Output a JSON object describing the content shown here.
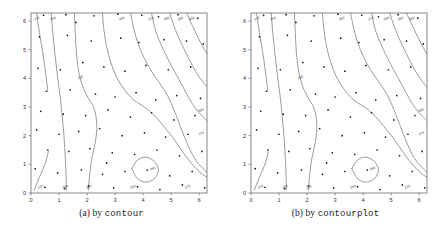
{
  "figure": {
    "background_color": "#ffffff",
    "line_color": "#4a4a4a",
    "point_color": "#111111",
    "axis_color": "#555555",
    "label_color": "#333333"
  },
  "panels": [
    {
      "id": "a",
      "caption_prefix": "(a) by ",
      "caption_code": "contour",
      "frame": {
        "x": 31,
        "y": 13,
        "w": 176,
        "h": 180
      },
      "xaxis": {
        "ticks": [
          0,
          1,
          2,
          3,
          4,
          5,
          6
        ],
        "tick_labels": [
          "0",
          "1",
          "2",
          "3",
          "4",
          "5",
          "6"
        ],
        "min": 0,
        "max": 6.28
      },
      "yaxis": {
        "ticks": [
          0,
          1,
          2,
          3,
          4,
          5,
          6
        ],
        "tick_labels": [
          "0",
          "1",
          "2",
          "3",
          "4",
          "5",
          "6"
        ],
        "min": 0,
        "max": 6.28
      }
    },
    {
      "id": "b",
      "caption_prefix": "(b) by ",
      "caption_code": "contourplot",
      "frame": {
        "x": 27,
        "y": 13,
        "w": 176,
        "h": 180
      },
      "xaxis": {
        "ticks": [
          0,
          1,
          2,
          3,
          4,
          5,
          6
        ],
        "tick_labels": [
          "0",
          "1",
          "2",
          "3",
          "4",
          "5",
          "6"
        ],
        "min": 0,
        "max": 6.28
      },
      "yaxis": {
        "ticks": [
          0,
          1,
          2,
          3,
          4,
          5,
          6
        ],
        "tick_labels": [
          "0",
          "1",
          "2",
          "3",
          "4",
          "5",
          "6"
        ],
        "min": 0,
        "max": 6.28
      }
    }
  ],
  "chart_data": {
    "type": "line",
    "title": "",
    "xlabel": "",
    "ylabel": "",
    "xlim": [
      0,
      6.28
    ],
    "ylim": [
      0,
      6.28
    ],
    "grid": false,
    "legend": "none",
    "contour_levels": [
      175,
      200,
      225,
      250,
      275,
      300,
      325,
      350
    ],
    "level_label_texts": [
      "175",
      "200",
      "225",
      "250",
      "275",
      "300",
      "325",
      "350"
    ],
    "series": [
      {
        "name": "contour-level-175",
        "level": 175,
        "paths": [
          [
            [
              0.2,
              6.28
            ],
            [
              0.3,
              5.6
            ],
            [
              0.42,
              4.9
            ],
            [
              0.52,
              4.2
            ],
            [
              0.6,
              3.55
            ]
          ],
          [
            [
              0.12,
              0.1
            ],
            [
              0.3,
              0.55
            ],
            [
              0.5,
              1.0
            ],
            [
              0.62,
              1.45
            ]
          ]
        ],
        "labels": [
          {
            "text": "175",
            "x": 0.22,
            "y": 6.05
          },
          {
            "text": "175",
            "x": 0.35,
            "y": 0.18
          }
        ]
      },
      {
        "name": "contour-level-200",
        "level": 200,
        "paths": [
          [
            [
              0.72,
              6.28
            ],
            [
              0.78,
              5.55
            ],
            [
              0.86,
              4.8
            ],
            [
              0.95,
              4.05
            ],
            [
              1.05,
              3.3
            ],
            [
              1.12,
              2.6
            ],
            [
              1.18,
              1.95
            ],
            [
              1.22,
              1.3
            ],
            [
              1.25,
              0.65
            ],
            [
              1.26,
              0.1
            ]
          ]
        ],
        "labels": [
          {
            "text": "200",
            "x": 0.8,
            "y": 6.05
          },
          {
            "text": "200",
            "x": 1.24,
            "y": 0.18
          }
        ]
      },
      {
        "name": "contour-level-225",
        "level": 225,
        "paths": [
          [
            [
              1.55,
              6.28
            ],
            [
              1.58,
              5.6
            ],
            [
              1.62,
              4.9
            ],
            [
              1.7,
              4.25
            ],
            [
              1.85,
              3.7
            ],
            [
              2.05,
              3.3
            ],
            [
              2.25,
              2.95
            ],
            [
              2.35,
              2.4
            ],
            [
              2.3,
              1.8
            ],
            [
              2.18,
              1.25
            ],
            [
              2.1,
              0.7
            ],
            [
              2.05,
              0.1
            ]
          ]
        ],
        "labels": [
          {
            "text": "225",
            "x": 1.78,
            "y": 4.0
          },
          {
            "text": "225",
            "x": 2.08,
            "y": 0.18
          }
        ]
      },
      {
        "name": "contour-level-250",
        "level": 250,
        "paths": [
          [
            [
              2.55,
              6.28
            ],
            [
              2.6,
              5.7
            ],
            [
              2.7,
              5.1
            ],
            [
              2.85,
              4.55
            ],
            [
              3.05,
              4.05
            ],
            [
              3.3,
              3.65
            ],
            [
              3.55,
              3.35
            ],
            [
              3.8,
              3.15
            ],
            [
              4.05,
              3.0
            ],
            [
              4.3,
              2.8
            ],
            [
              4.55,
              2.55
            ],
            [
              4.8,
              2.25
            ],
            [
              5.05,
              1.95
            ],
            [
              5.3,
              1.6
            ],
            [
              5.55,
              1.25
            ],
            [
              5.8,
              0.95
            ],
            [
              6.05,
              0.7
            ],
            [
              6.28,
              0.55
            ]
          ]
        ],
        "labels": [
          {
            "text": "250",
            "x": 3.25,
            "y": 6.05
          },
          {
            "text": "250",
            "x": 3.65,
            "y": 0.18
          }
        ]
      },
      {
        "name": "contour-level-275",
        "level": 275,
        "paths": [
          [
            [
              3.55,
              6.28
            ],
            [
              3.7,
              5.6
            ],
            [
              3.9,
              5.0
            ],
            [
              4.15,
              4.5
            ],
            [
              4.4,
              4.1
            ],
            [
              4.65,
              3.75
            ],
            [
              4.9,
              3.35
            ],
            [
              5.1,
              2.9
            ],
            [
              5.3,
              2.4
            ],
            [
              5.5,
              1.9
            ],
            [
              5.7,
              1.45
            ],
            [
              5.95,
              1.05
            ],
            [
              6.2,
              0.8
            ],
            [
              6.28,
              0.72
            ]
          ]
        ],
        "labels": [
          {
            "text": "275",
            "x": 4.3,
            "y": 6.05
          },
          {
            "text": "275",
            "x": 5.6,
            "y": 0.18
          },
          {
            "text": "275",
            "x": 6.1,
            "y": 2.05
          }
        ]
      },
      {
        "name": "contour-level-300",
        "level": 300,
        "paths": [
          [
            [
              4.3,
              6.28
            ],
            [
              4.45,
              5.65
            ],
            [
              4.7,
              5.05
            ],
            [
              4.95,
              4.55
            ],
            [
              5.2,
              4.1
            ],
            [
              5.45,
              3.65
            ],
            [
              5.7,
              3.2
            ],
            [
              5.95,
              2.85
            ],
            [
              6.2,
              2.6
            ],
            [
              6.28,
              2.52
            ]
          ]
        ],
        "labels": [
          {
            "text": "300",
            "x": 4.85,
            "y": 6.05
          },
          {
            "text": "300",
            "x": 6.08,
            "y": 2.85
          }
        ]
      },
      {
        "name": "contour-level-325",
        "level": 325,
        "paths": [
          [
            [
              4.95,
              6.28
            ],
            [
              5.15,
              5.7
            ],
            [
              5.4,
              5.15
            ],
            [
              5.65,
              4.65
            ],
            [
              5.9,
              4.2
            ],
            [
              6.15,
              3.85
            ],
            [
              6.28,
              3.7
            ]
          ]
        ],
        "labels": [
          {
            "text": "325",
            "x": 5.35,
            "y": 6.05
          }
        ]
      },
      {
        "name": "contour-level-350",
        "level": 350,
        "paths": [
          [
            [
              5.55,
              6.28
            ],
            [
              5.8,
              5.75
            ],
            [
              6.05,
              5.25
            ],
            [
              6.28,
              4.85
            ]
          ],
          [
            [
              3.6,
              0.85
            ],
            [
              3.8,
              1.15
            ],
            [
              4.1,
              1.25
            ],
            [
              4.4,
              1.1
            ],
            [
              4.55,
              0.8
            ],
            [
              4.4,
              0.5
            ],
            [
              4.1,
              0.38
            ],
            [
              3.8,
              0.5
            ],
            [
              3.6,
              0.85
            ]
          ]
        ],
        "labels": [
          {
            "text": "350",
            "x": 5.75,
            "y": 6.05
          },
          {
            "text": "350",
            "x": 4.35,
            "y": 0.82
          }
        ]
      }
    ],
    "scatter": {
      "name": "data-points",
      "marker": "dot",
      "count": 74,
      "points": [
        [
          0.45,
          6.2
        ],
        [
          1.25,
          6.22
        ],
        [
          2.25,
          6.18
        ],
        [
          3.1,
          6.24
        ],
        [
          3.95,
          6.2
        ],
        [
          4.55,
          6.15
        ],
        [
          5.25,
          6.22
        ],
        [
          5.95,
          6.1
        ],
        [
          0.3,
          5.45
        ],
        [
          1.3,
          5.5
        ],
        [
          2.15,
          5.3
        ],
        [
          3.2,
          5.4
        ],
        [
          3.85,
          5.25
        ],
        [
          4.75,
          5.35
        ],
        [
          5.55,
          5.3
        ],
        [
          6.15,
          5.2
        ],
        [
          0.25,
          4.35
        ],
        [
          1.05,
          4.3
        ],
        [
          1.85,
          4.55
        ],
        [
          2.6,
          4.4
        ],
        [
          3.35,
          4.25
        ],
        [
          4.1,
          4.45
        ],
        [
          4.9,
          4.3
        ],
        [
          5.7,
          4.4
        ],
        [
          0.55,
          3.55
        ],
        [
          1.4,
          3.6
        ],
        [
          2.3,
          3.45
        ],
        [
          3.0,
          3.35
        ],
        [
          3.75,
          3.5
        ],
        [
          4.45,
          3.25
        ],
        [
          5.2,
          3.4
        ],
        [
          6.05,
          3.3
        ],
        [
          0.35,
          2.85
        ],
        [
          1.15,
          2.75
        ],
        [
          1.95,
          2.7
        ],
        [
          2.75,
          2.9
        ],
        [
          3.55,
          2.65
        ],
        [
          4.3,
          2.8
        ],
        [
          5.1,
          2.55
        ],
        [
          5.85,
          2.7
        ],
        [
          0.2,
          2.2
        ],
        [
          1.0,
          2.05
        ],
        [
          1.7,
          2.15
        ],
        [
          2.45,
          2.25
        ],
        [
          3.25,
          2.0
        ],
        [
          4.05,
          2.1
        ],
        [
          4.8,
          1.95
        ],
        [
          5.6,
          2.05
        ],
        [
          0.6,
          1.5
        ],
        [
          1.35,
          1.45
        ],
        [
          2.1,
          1.55
        ],
        [
          2.9,
          1.4
        ],
        [
          3.7,
          1.35
        ],
        [
          4.5,
          1.5
        ],
        [
          5.3,
          1.3
        ],
        [
          6.1,
          1.45
        ],
        [
          0.15,
          0.85
        ],
        [
          0.95,
          0.7
        ],
        [
          1.8,
          0.8
        ],
        [
          2.55,
          0.65
        ],
        [
          3.35,
          0.75
        ],
        [
          4.15,
          0.8
        ],
        [
          4.95,
          0.6
        ],
        [
          5.75,
          0.75
        ],
        [
          0.5,
          0.2
        ],
        [
          1.2,
          0.15
        ],
        [
          2.05,
          0.25
        ],
        [
          2.95,
          0.18
        ],
        [
          3.8,
          0.22
        ],
        [
          4.6,
          0.12
        ],
        [
          5.4,
          0.28
        ],
        [
          6.2,
          0.18
        ],
        [
          1.6,
          5.95
        ],
        [
          2.7,
          1.05
        ]
      ]
    }
  }
}
